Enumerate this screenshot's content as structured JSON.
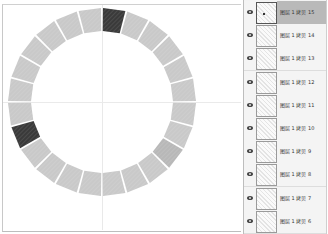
{
  "canvas": {
    "ring": {
      "center": [
        102,
        102
      ],
      "outer_radius": 94,
      "inner_radius": 71,
      "segment_count": 24,
      "segment_gap_deg": 1.2,
      "segment_color": "#c9c9c9",
      "highlight_color": "#3a3a3a",
      "mid_color": "#b8b8b8",
      "dark_segments": [
        0,
        16
      ],
      "mid_segments": [
        8
      ]
    }
  },
  "layers_panel": {
    "selected_index": 0,
    "layers": [
      {
        "label": "图层 1 拷贝 15",
        "visible": true
      },
      {
        "label": "图层 1 拷贝 14",
        "visible": true
      },
      {
        "label": "图层 1 拷贝 13",
        "visible": true
      },
      {
        "label": "图层 1 拷贝 12",
        "visible": true
      },
      {
        "label": "图层 1 拷贝 11",
        "visible": true
      },
      {
        "label": "图层 1 拷贝 10",
        "visible": true
      },
      {
        "label": "图层 1 拷贝 9",
        "visible": true
      },
      {
        "label": "图层 1 拷贝 8",
        "visible": true
      },
      {
        "label": "图层 1 拷贝 7",
        "visible": true
      },
      {
        "label": "图层 1 拷贝 6",
        "visible": true
      }
    ]
  }
}
